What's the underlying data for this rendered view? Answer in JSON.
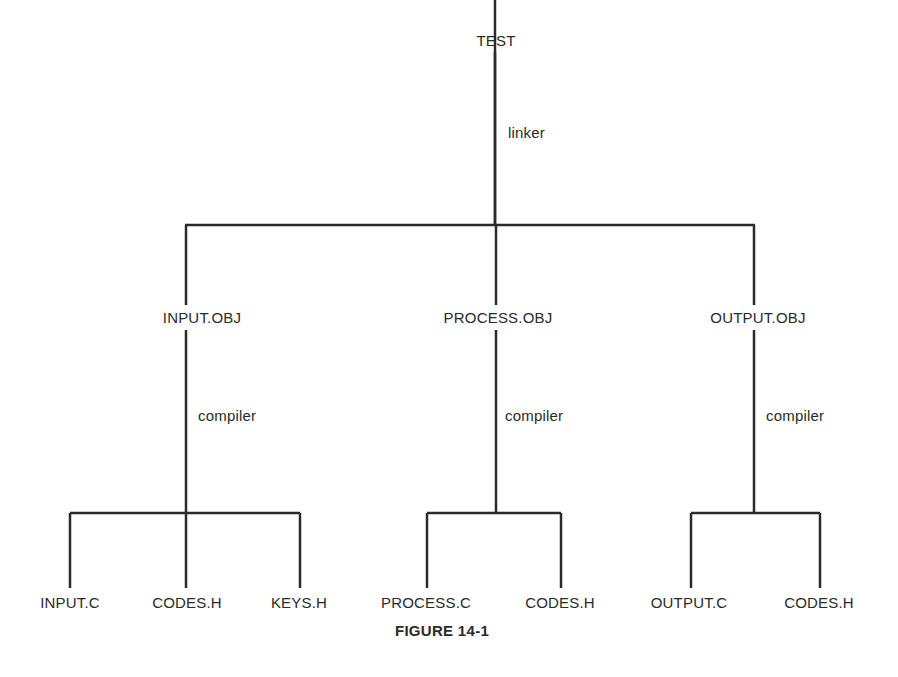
{
  "diagram": {
    "root": {
      "label": "TEST",
      "edge_label": "linker"
    },
    "objects": [
      {
        "label": "INPUT.OBJ",
        "edge_label": "compiler",
        "sources": [
          "INPUT.C",
          "CODES.H",
          "KEYS.H"
        ]
      },
      {
        "label": "PROCESS.OBJ",
        "edge_label": "compiler",
        "sources": [
          "PROCESS.C",
          "CODES.H"
        ]
      },
      {
        "label": "OUTPUT.OBJ",
        "edge_label": "compiler",
        "sources": [
          "OUTPUT.C",
          "CODES.H"
        ]
      }
    ],
    "caption": "FIGURE 14-1"
  },
  "colors": {
    "line": "#2b2b2b",
    "text": "#2a2a2a",
    "background": "#ffffff"
  }
}
